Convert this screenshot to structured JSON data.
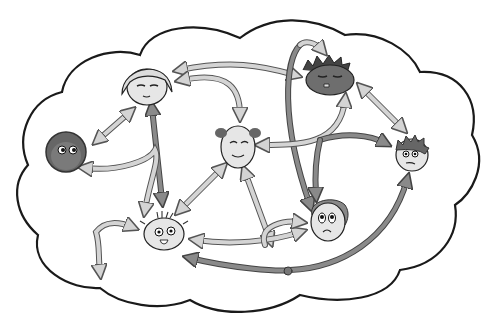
{
  "illustration": {
    "description": "Cartoon thought-cloud containing seven faces connected by tangled double-headed arrows",
    "colors": {
      "background": "#ffffff",
      "outline": "#1a1a1a",
      "arrow_light": "#cfcfcf",
      "arrow_dark": "#8a8a8a",
      "face_light": "#e6e6e6",
      "face_dark": "#6e6e6e",
      "hair_dark": "#555555"
    },
    "faces": [
      {
        "id": "woman-top-left",
        "expression": "sleepy",
        "x": 147,
        "y": 85
      },
      {
        "id": "curly-left",
        "expression": "wide-eyed",
        "x": 65,
        "y": 152
      },
      {
        "id": "bald-center",
        "expression": "content",
        "x": 237,
        "y": 147
      },
      {
        "id": "spiky-top-right",
        "expression": "eyes-closed",
        "x": 330,
        "y": 75
      },
      {
        "id": "boy-right",
        "expression": "worried",
        "x": 412,
        "y": 155
      },
      {
        "id": "curly-bottom-right",
        "expression": "sad",
        "x": 328,
        "y": 222
      },
      {
        "id": "baby-bottom-left",
        "expression": "surprised",
        "x": 163,
        "y": 235
      }
    ]
  }
}
